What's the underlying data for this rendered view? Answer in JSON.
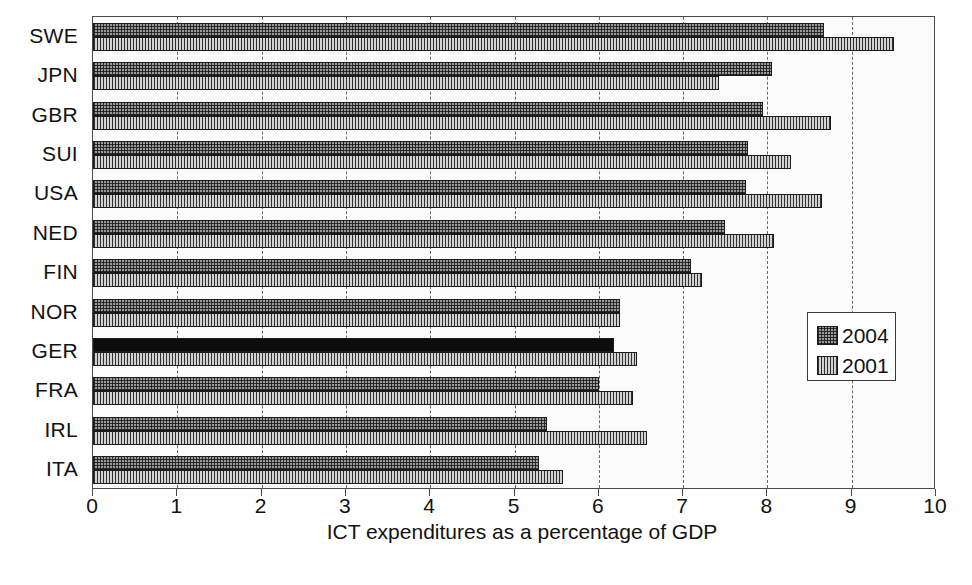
{
  "chart_data": {
    "type": "bar",
    "orientation": "horizontal",
    "title": "",
    "xlabel": "ICT expenditures as a percentage of GDP",
    "ylabel": "",
    "xlim": [
      0,
      10
    ],
    "xticks": [
      0,
      1,
      2,
      3,
      4,
      5,
      6,
      7,
      8,
      9,
      10
    ],
    "xtick_labels": [
      "0",
      "1",
      "2",
      "3",
      "4",
      "5",
      "6",
      "7",
      "8",
      "9",
      "10"
    ],
    "grid": true,
    "grid_axis": "x",
    "legend_position": "center-right",
    "categories": [
      "SWE",
      "JPN",
      "GBR",
      "SUI",
      "USA",
      "NED",
      "FIN",
      "NOR",
      "GER",
      "FRA",
      "IRL",
      "ITA"
    ],
    "series": [
      {
        "name": "2004",
        "pattern": "cross-hatch",
        "color": "#9a9a9a",
        "values": [
          8.67,
          8.05,
          7.95,
          7.77,
          7.75,
          7.5,
          7.09,
          6.25,
          6.18,
          6.0,
          5.38,
          5.29
        ]
      },
      {
        "name": "2001",
        "pattern": "vertical-stripe",
        "color": "#d2d2d2",
        "values": [
          9.5,
          7.42,
          8.75,
          8.28,
          8.65,
          8.08,
          7.23,
          6.25,
          6.45,
          6.4,
          6.57,
          5.57
        ]
      }
    ],
    "highlight": {
      "category": "GER",
      "series": "2004",
      "color": "#0c0c0c"
    }
  },
  "legend": {
    "items": [
      {
        "label": "2004",
        "swatch": "cross-hatch-swatch"
      },
      {
        "label": "2001",
        "swatch": "vertical-stripe-swatch"
      }
    ]
  },
  "axis": {
    "x_title": "ICT expenditures as a percentage of GDP"
  }
}
